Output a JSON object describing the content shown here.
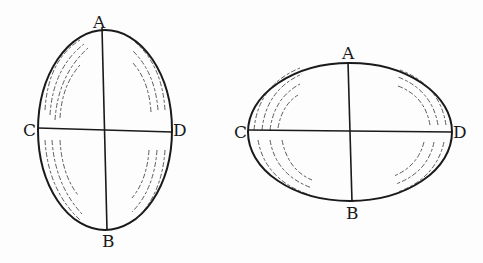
{
  "figures": [
    {
      "name": "prolate-ellipsoid",
      "labels": {
        "top": "A",
        "bottom": "B",
        "left": "C",
        "right": "D"
      },
      "center": [
        105,
        130
      ],
      "rx": 67,
      "ry": 100
    },
    {
      "name": "oblate-ellipsoid",
      "labels": {
        "top": "A",
        "bottom": "B",
        "left": "C",
        "right": "D"
      },
      "center": [
        350,
        132
      ],
      "rx": 102,
      "ry": 69
    }
  ],
  "colors": {
    "ink": "#1a1a1a",
    "paper": "#fdfdfd"
  }
}
